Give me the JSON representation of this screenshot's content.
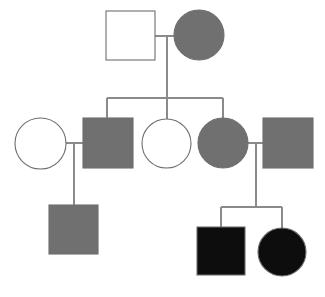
{
  "diagram": {
    "type": "pedigree",
    "width": 325,
    "height": 297,
    "background": "#ffffff"
  },
  "legend_colors": {
    "unaffected_fill": "#ffffff",
    "carrier_fill": "#707070",
    "affected_fill": "#0d0d0d",
    "outline": "#6e6e6e",
    "connector": "#8a8a8a"
  },
  "generations": [
    {
      "id": "generation-1",
      "label": "I",
      "individuals": [
        {
          "id": "I-1",
          "shape": "square",
          "sex": "male",
          "status": "unaffected",
          "fill": "#ffffff",
          "x": 106,
          "y": 11,
          "size": 49
        },
        {
          "id": "I-2",
          "shape": "circle",
          "sex": "female",
          "status": "carrier",
          "fill": "#707070",
          "x": 174,
          "y": 10,
          "size": 50
        }
      ]
    },
    {
      "id": "generation-2",
      "label": "II",
      "individuals": [
        {
          "id": "II-1",
          "shape": "circle",
          "sex": "female",
          "status": "unaffected",
          "fill": "#ffffff",
          "x": 15,
          "y": 118,
          "size": 51
        },
        {
          "id": "II-2",
          "shape": "square",
          "sex": "male",
          "status": "carrier",
          "fill": "#707070",
          "x": 83,
          "y": 118,
          "size": 50
        },
        {
          "id": "II-3",
          "shape": "circle",
          "sex": "female",
          "status": "unaffected",
          "fill": "#ffffff",
          "x": 142,
          "y": 119,
          "size": 49
        },
        {
          "id": "II-4",
          "shape": "circle",
          "sex": "female",
          "status": "carrier",
          "fill": "#707070",
          "x": 198,
          "y": 118,
          "size": 50
        },
        {
          "id": "II-5",
          "shape": "square",
          "sex": "male",
          "status": "carrier",
          "fill": "#707070",
          "x": 263,
          "y": 118,
          "size": 50
        }
      ]
    },
    {
      "id": "generation-3",
      "label": "III",
      "individuals": [
        {
          "id": "III-1",
          "shape": "square",
          "sex": "male",
          "status": "carrier",
          "fill": "#707070",
          "x": 49,
          "y": 205,
          "size": 49
        },
        {
          "id": "III-2",
          "shape": "square",
          "sex": "male",
          "status": "affected",
          "fill": "#0d0d0d",
          "x": 197,
          "y": 227,
          "size": 48
        },
        {
          "id": "III-3",
          "shape": "circle",
          "sex": "female",
          "status": "affected",
          "fill": "#0d0d0d",
          "x": 258,
          "y": 228,
          "size": 48
        }
      ]
    }
  ],
  "matings": [
    {
      "id": "mating-1",
      "partners": [
        "I-1",
        "I-2"
      ],
      "line_y": 36,
      "x1": 155,
      "x2": 174,
      "descent_x": 167,
      "descent_y1": 36,
      "descent_y2": 98
    },
    {
      "id": "mating-2",
      "partners": [
        "II-1",
        "II-2"
      ],
      "line_y": 143,
      "x1": 66,
      "x2": 83,
      "descent_x": 74,
      "descent_y1": 143,
      "descent_y2": 205
    },
    {
      "id": "mating-3",
      "partners": [
        "II-4",
        "II-5"
      ],
      "line_y": 143,
      "x1": 248,
      "x2": 263,
      "descent_x": 256,
      "descent_y1": 143,
      "descent_y2": 207
    }
  ],
  "sibships": [
    {
      "id": "sibship-1",
      "parents": "mating-1",
      "bar_y": 98,
      "bar_x1": 107,
      "bar_x2": 223,
      "children": [
        {
          "id": "II-2",
          "drop_x": 107,
          "drop_y1": 98,
          "drop_y2": 118
        },
        {
          "id": "II-3",
          "drop_x": 167,
          "drop_y1": 98,
          "drop_y2": 120
        },
        {
          "id": "II-4",
          "drop_x": 223,
          "drop_y1": 98,
          "drop_y2": 118
        }
      ]
    },
    {
      "id": "sibship-2",
      "parents": "mating-3",
      "bar_y": 207,
      "bar_x1": 221,
      "bar_x2": 282,
      "children": [
        {
          "id": "III-2",
          "drop_x": 221,
          "drop_y1": 207,
          "drop_y2": 227
        },
        {
          "id": "III-3",
          "drop_x": 282,
          "drop_y1": 207,
          "drop_y2": 229
        }
      ]
    }
  ],
  "single_descents": [
    {
      "id": "descent-III-1",
      "from": "mating-2",
      "to": "III-1",
      "x": 74,
      "y1": 143,
      "y2": 205
    }
  ]
}
